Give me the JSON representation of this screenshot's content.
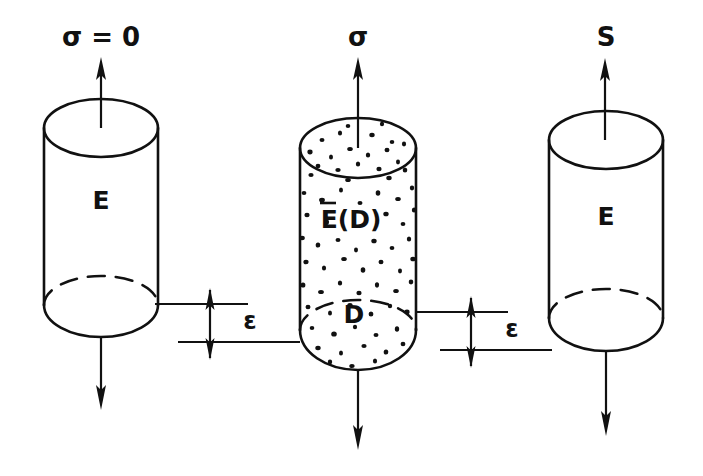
{
  "figure": {
    "background_color": "#ffffff",
    "ink_color": "#111111",
    "width": 703,
    "height": 476
  },
  "specimens": [
    {
      "id": "virgin-undamaged",
      "name": "Undamaged specimen at zero stress",
      "top_label": "σ = 0",
      "body_label": "E",
      "speckled": false,
      "has_dashed_hidden_edge": true,
      "top_arrow": "up",
      "bottom_arrow": "down"
    },
    {
      "id": "damaged",
      "name": "Damaged specimen under stress sigma",
      "top_label": "σ",
      "body_label": "E(D)",
      "body_label_overbar": true,
      "damage_label": "D",
      "speckled": true,
      "has_dashed_hidden_edge": true,
      "top_arrow": "up",
      "bottom_arrow": "down"
    },
    {
      "id": "equivalent-effective",
      "name": "Equivalent undamaged specimen under effective stress S",
      "top_label": "S",
      "body_label": "E",
      "speckled": false,
      "has_dashed_hidden_edge": true,
      "top_arrow": "up",
      "bottom_arrow": "down"
    }
  ],
  "strain_indicators": [
    {
      "id": "strain-left",
      "label": "ε",
      "name": "Strain equivalence between specimen 1 and specimen 2",
      "arrow_style": "double-headed-vertical"
    },
    {
      "id": "strain-right",
      "label": "ε",
      "name": "Strain equivalence between specimen 2 and specimen 3",
      "arrow_style": "double-headed-vertical"
    }
  ],
  "symbols": {
    "stress": "σ",
    "effective_stress": "S",
    "strain": "ε",
    "youngs_modulus": "E",
    "effective_modulus": "E(D)",
    "damage_variable": "D",
    "zero": "0"
  }
}
